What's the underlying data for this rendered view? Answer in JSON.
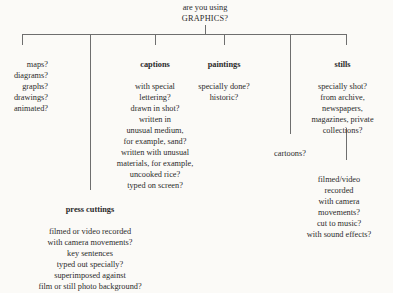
{
  "diagram": {
    "type": "tree",
    "title_line_1": "are you using",
    "title_line_2": "GRAPHICS?",
    "root_label": "are you using GRAPHICS?",
    "ink_color": "#2b2b2b",
    "line_color": "#6e6e6e",
    "background_color": "#fbfaf7"
  },
  "branches": {
    "maps": {
      "heading": "",
      "items": [
        "maps?",
        "diagrams?",
        "graphs?",
        "drawings?",
        "animated?"
      ],
      "text": "maps?\ndiagrams?\ngraphs?\ndrawings?\nanimated?"
    },
    "press_cuttings": {
      "heading": "press cuttings",
      "items": [
        "filmed or video recorded",
        "with camera movements?",
        "key sentences",
        "typed out specially?",
        "superimposed against",
        "film or still photo background?"
      ],
      "text": "filmed or video recorded\nwith camera movements?\nkey sentences\ntyped out specially?\nsuperimposed against\nfilm or still photo background?"
    },
    "captions": {
      "heading": "captions",
      "items": [
        "with special",
        "lettering?",
        "drawn in shot?",
        "written in",
        "unusual medium,",
        "for example, sand?",
        "written with unusual",
        "materials, for example,",
        "uncooked rice?",
        "typed on screen?"
      ],
      "text": "with special\nlettering?\ndrawn in shot?\nwritten in\nunusual medium,\nfor example, sand?\nwritten with unusual\nmaterials, for example,\nuncooked rice?\ntyped on screen?"
    },
    "paintings": {
      "heading": "paintings",
      "items": [
        "specially done?",
        "historic?"
      ],
      "text": "specially done?\nhistoric?"
    },
    "cartoons": {
      "heading": "",
      "items": [
        "cartoons?"
      ],
      "text": "cartoons?"
    },
    "stills": {
      "heading": "stills",
      "items": [
        "specially shot?",
        "from archive,",
        "newspapers,",
        "magazines, private",
        "collections?"
      ],
      "text": "specially shot?\nfrom archive,\nnewspapers,\nmagazines, private\ncollections?"
    },
    "filmed_video": {
      "heading": "",
      "items": [
        "filmed/video",
        "recorded",
        "with camera",
        "movements?",
        "cut to music?",
        "with sound effects?"
      ],
      "text": "filmed/video\nrecorded\nwith camera\nmovements?\ncut to music?\nwith sound effects?"
    }
  }
}
